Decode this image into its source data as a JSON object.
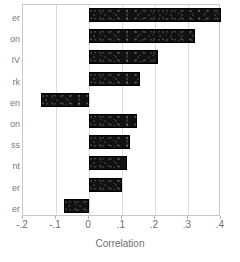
{
  "chart_data": {
    "type": "bar",
    "orientation": "horizontal",
    "title": "",
    "xlabel": "Correlation",
    "ylabel": "",
    "xlim": [
      -0.2,
      0.4
    ],
    "xticks": [
      -0.2,
      -0.1,
      0,
      0.1,
      0.2,
      0.3,
      0.4
    ],
    "xticklabels": [
      "-.2",
      "-.1",
      "0",
      ".1",
      ".2",
      ".3",
      ".4"
    ],
    "grid": true,
    "gridlines_axis": "x",
    "legend": "none",
    "bar_color": "#111111",
    "categories": [
      "er",
      "on",
      "IV",
      "rk",
      "en",
      "on",
      "ss",
      "nt",
      "er",
      "er"
    ],
    "categories_note": "y-axis labels are cropped at the left edge of the screenshot; only trailing glyphs are legible",
    "values": [
      0.4,
      0.32,
      0.21,
      0.155,
      -0.145,
      0.145,
      0.125,
      0.115,
      0.1,
      -0.075
    ]
  },
  "axis": {
    "x_title": "Correlation"
  }
}
